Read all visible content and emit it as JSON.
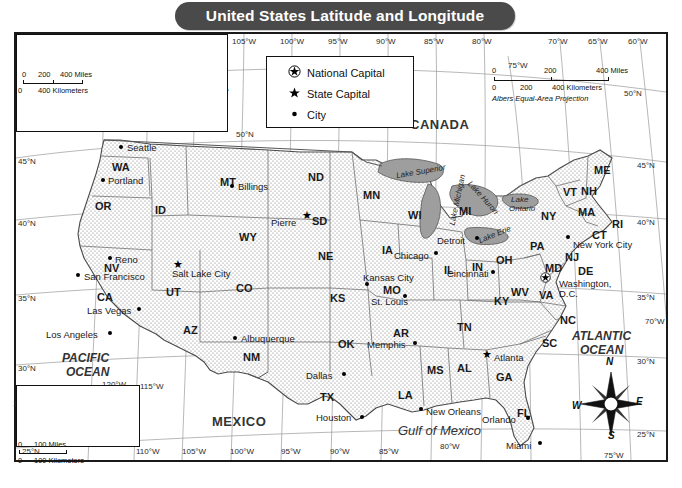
{
  "title": "United States Latitude and Longitude",
  "legend": {
    "title": "",
    "items": [
      {
        "symbol": "national-capital",
        "label": "National Capital"
      },
      {
        "symbol": "state-capital",
        "label": "State Capital"
      },
      {
        "symbol": "city",
        "label": "City"
      }
    ]
  },
  "projection_note": "Albers Equal-Area Projection",
  "main_scale": {
    "miles": [
      "0",
      "200",
      "400 Miles"
    ],
    "kilometers": [
      "0",
      "200",
      "400 Kilometers"
    ]
  },
  "alaska_scale": {
    "miles": [
      "0",
      "200",
      "400 Miles"
    ],
    "kilometers": [
      "0",
      "400 Kilometers"
    ]
  },
  "hawaii_scale": {
    "miles": [
      "0",
      "100 Miles"
    ],
    "kilometers": [
      "0",
      "100 Kilometers"
    ]
  },
  "countries": [
    {
      "name": "CANADA",
      "x": 410,
      "y": 118
    },
    {
      "name": "MEXICO",
      "x": 212,
      "y": 415
    },
    {
      "name": "RUSSIA",
      "x": 55,
      "y": 47
    },
    {
      "name": "CANADA",
      "x": 170,
      "y": 80
    }
  ],
  "oceans": [
    {
      "name": "PACIFIC",
      "x": 62,
      "y": 352
    },
    {
      "name": "OCEAN",
      "x": 66,
      "y": 366
    },
    {
      "name": "ATLANTIC",
      "x": 572,
      "y": 330
    },
    {
      "name": "OCEAN",
      "x": 580,
      "y": 344
    },
    {
      "name": "Gulf of Mexico",
      "x": 398,
      "y": 424
    }
  ],
  "lakes": [
    {
      "name": "Lake Superior",
      "x": 396,
      "y": 168
    },
    {
      "name": "Lake Michigan",
      "x": 432,
      "y": 196
    },
    {
      "name": "Lake Huron",
      "x": 462,
      "y": 194
    },
    {
      "name": "Lake Erie",
      "x": 478,
      "y": 231
    },
    {
      "name": "Lake",
      "x": 511,
      "y": 196
    },
    {
      "name": "Ontario",
      "x": 509,
      "y": 205
    }
  ],
  "states": [
    {
      "abbr": "WA",
      "x": 112,
      "y": 162
    },
    {
      "abbr": "OR",
      "x": 95,
      "y": 201
    },
    {
      "abbr": "ID",
      "x": 155,
      "y": 205
    },
    {
      "abbr": "MT",
      "x": 220,
      "y": 177
    },
    {
      "abbr": "ND",
      "x": 308,
      "y": 172
    },
    {
      "abbr": "SD",
      "x": 312,
      "y": 216
    },
    {
      "abbr": "MN",
      "x": 363,
      "y": 190
    },
    {
      "abbr": "WI",
      "x": 408,
      "y": 210
    },
    {
      "abbr": "MI",
      "x": 459,
      "y": 206
    },
    {
      "abbr": "NY",
      "x": 541,
      "y": 211
    },
    {
      "abbr": "ME",
      "x": 594,
      "y": 165
    },
    {
      "abbr": "VT",
      "x": 563,
      "y": 187
    },
    {
      "abbr": "NH",
      "x": 581,
      "y": 186
    },
    {
      "abbr": "MA",
      "x": 578,
      "y": 207
    },
    {
      "abbr": "RI",
      "x": 612,
      "y": 219
    },
    {
      "abbr": "CT",
      "x": 592,
      "y": 230
    },
    {
      "abbr": "PA",
      "x": 530,
      "y": 241
    },
    {
      "abbr": "NJ",
      "x": 565,
      "y": 252
    },
    {
      "abbr": "OH",
      "x": 496,
      "y": 255
    },
    {
      "abbr": "IN",
      "x": 472,
      "y": 262
    },
    {
      "abbr": "IL",
      "x": 444,
      "y": 265
    },
    {
      "abbr": "IA",
      "x": 382,
      "y": 245
    },
    {
      "abbr": "NE",
      "x": 318,
      "y": 251
    },
    {
      "abbr": "WY",
      "x": 239,
      "y": 232
    },
    {
      "abbr": "NV",
      "x": 104,
      "y": 263
    },
    {
      "abbr": "UT",
      "x": 166,
      "y": 287
    },
    {
      "abbr": "CA",
      "x": 97,
      "y": 292
    },
    {
      "abbr": "CO",
      "x": 236,
      "y": 283
    },
    {
      "abbr": "KS",
      "x": 330,
      "y": 293
    },
    {
      "abbr": "MO",
      "x": 383,
      "y": 285
    },
    {
      "abbr": "KY",
      "x": 494,
      "y": 296
    },
    {
      "abbr": "WV",
      "x": 511,
      "y": 287
    },
    {
      "abbr": "VA",
      "x": 539,
      "y": 290
    },
    {
      "abbr": "MD",
      "x": 545,
      "y": 263
    },
    {
      "abbr": "DE",
      "x": 578,
      "y": 266
    },
    {
      "abbr": "NC",
      "x": 560,
      "y": 315
    },
    {
      "abbr": "TN",
      "x": 457,
      "y": 322
    },
    {
      "abbr": "SC",
      "x": 542,
      "y": 338
    },
    {
      "abbr": "AR",
      "x": 393,
      "y": 328
    },
    {
      "abbr": "AZ",
      "x": 183,
      "y": 325
    },
    {
      "abbr": "NM",
      "x": 243,
      "y": 352
    },
    {
      "abbr": "OK",
      "x": 338,
      "y": 339
    },
    {
      "abbr": "TX",
      "x": 320,
      "y": 392
    },
    {
      "abbr": "LA",
      "x": 398,
      "y": 390
    },
    {
      "abbr": "MS",
      "x": 427,
      "y": 365
    },
    {
      "abbr": "AL",
      "x": 457,
      "y": 363
    },
    {
      "abbr": "GA",
      "x": 496,
      "y": 372
    },
    {
      "abbr": "FL",
      "x": 517,
      "y": 408
    }
  ],
  "cities": [
    {
      "name": "Seattle",
      "x": 121,
      "y": 147,
      "type": "city",
      "dx": 6,
      "dy": -4
    },
    {
      "name": "Portland",
      "x": 103,
      "y": 180,
      "type": "city",
      "dx": 5,
      "dy": -4
    },
    {
      "name": "Billings",
      "x": 232,
      "y": 186,
      "type": "city",
      "dx": 6,
      "dy": -4
    },
    {
      "name": "Pierre",
      "x": 307,
      "y": 216,
      "type": "capital",
      "dx": -36,
      "dy": 2
    },
    {
      "name": "Reno",
      "x": 110,
      "y": 258,
      "type": "city",
      "dx": 5,
      "dy": -3
    },
    {
      "name": "San Francisco",
      "x": 78,
      "y": 275,
      "type": "city",
      "dx": 6,
      "dy": -3
    },
    {
      "name": "Salt Lake City",
      "x": 178,
      "y": 265,
      "type": "capital",
      "dx": -6,
      "dy": 4
    },
    {
      "name": "Las Vegas",
      "x": 139,
      "y": 309,
      "type": "city",
      "dx": -52,
      "dy": -3
    },
    {
      "name": "Los Angeles",
      "x": 110,
      "y": 333,
      "type": "city",
      "dx": -64,
      "dy": -3
    },
    {
      "name": "Albuquerque",
      "x": 235,
      "y": 338,
      "type": "city",
      "dx": 6,
      "dy": -4
    },
    {
      "name": "Dallas",
      "x": 344,
      "y": 374,
      "type": "city",
      "dx": -38,
      "dy": -3
    },
    {
      "name": "Houston",
      "x": 362,
      "y": 417,
      "type": "city",
      "dx": -46,
      "dy": -4
    },
    {
      "name": "Kansas City",
      "x": 367,
      "y": 284,
      "type": "city",
      "dx": -4,
      "dy": -11
    },
    {
      "name": "St. Louis",
      "x": 405,
      "y": 296,
      "type": "city",
      "dx": -34,
      "dy": 1
    },
    {
      "name": "Chicago",
      "x": 436,
      "y": 253,
      "type": "city",
      "dx": -42,
      "dy": -2
    },
    {
      "name": "Detroit",
      "x": 477,
      "y": 238,
      "type": "city",
      "dx": -40,
      "dy": -2
    },
    {
      "name": "Cincinnati",
      "x": 493,
      "y": 272,
      "type": "city",
      "dx": -46,
      "dy": -3
    },
    {
      "name": "Memphis",
      "x": 415,
      "y": 343,
      "type": "city",
      "dx": -48,
      "dy": -3
    },
    {
      "name": "Atlanta",
      "x": 487,
      "y": 355,
      "type": "capital",
      "dx": 7,
      "dy": -2
    },
    {
      "name": "New Orleans",
      "x": 421,
      "y": 409,
      "type": "city",
      "dx": 5,
      "dy": -2
    },
    {
      "name": "Orlando",
      "x": 528,
      "y": 418,
      "type": "city",
      "dx": -46,
      "dy": -3
    },
    {
      "name": "Miami",
      "x": 540,
      "y": 443,
      "type": "city",
      "dx": -34,
      "dy": -2
    },
    {
      "name": "New York City",
      "x": 568,
      "y": 237,
      "type": "city",
      "dx": 5,
      "dy": 3
    },
    {
      "name": "Washington, D.C.",
      "x": 545,
      "y": 274,
      "type": "national",
      "dx": 14,
      "dy": 5
    }
  ],
  "dc_label_line2": "D.C.",
  "alaska_inset": {
    "places": [
      {
        "name": "RUSSIA",
        "x": 38,
        "y": 12,
        "cls": "country-sm"
      },
      {
        "name": "ALASKA",
        "x": 110,
        "y": 50,
        "cls": "country-sm"
      },
      {
        "name": "CANADA",
        "x": 160,
        "y": 59,
        "cls": "country-sm"
      },
      {
        "name": "Juneau",
        "x": 128,
        "y": 72,
        "cls": "city-sm"
      },
      {
        "name": "PACIFIC",
        "x": 130,
        "y": 80,
        "cls": "ocean-sm"
      },
      {
        "name": "OCEAN",
        "x": 130,
        "y": 88,
        "cls": "ocean-sm"
      }
    ],
    "grid": [
      {
        "t": "65°N",
        "x": 14,
        "y": 3
      },
      {
        "t": "60°N",
        "x": 6,
        "y": 24
      },
      {
        "t": "55°N",
        "x": 38,
        "y": 74
      },
      {
        "t": "70°N",
        "x": 135,
        "y": 4
      },
      {
        "t": "180°",
        "x": 5,
        "y": 86
      },
      {
        "t": "170°W",
        "x": 42,
        "y": 90
      },
      {
        "t": "160°W",
        "x": 76,
        "y": 90
      },
      {
        "t": "150°W",
        "x": 112,
        "y": 90
      },
      {
        "t": "140°W",
        "x": 148,
        "y": 90
      }
    ]
  },
  "hawaii_inset": {
    "places": [
      {
        "name": "HAWAII",
        "x": 30,
        "y": 3,
        "cls": "country-sm"
      },
      {
        "name": "Honolulu",
        "x": 10,
        "y": 24,
        "cls": "city-sm"
      },
      {
        "name": "PACIFIC",
        "x": 38,
        "y": 31,
        "cls": "ocean-sm"
      },
      {
        "name": "OCEAN",
        "x": 38,
        "y": 41,
        "cls": "ocean-sm"
      }
    ],
    "grid": [
      {
        "t": "160°W",
        "x": -4,
        "y": 14
      },
      {
        "t": "155°W",
        "x": 78,
        "y": 14
      },
      {
        "t": "20°N",
        "x": 12,
        "y": 36
      }
    ]
  },
  "graticule": {
    "top_longitudes": [
      "110°W",
      "105°W",
      "100°W",
      "95°W",
      "90°W",
      "85°W",
      "80°W",
      "70°W",
      "65°W",
      "60°W"
    ],
    "top_longitudes_x": [
      196,
      244,
      292,
      340,
      388,
      436,
      484,
      560,
      600,
      640
    ],
    "upper_extra": [
      {
        "t": "75°W",
        "x": 508,
        "y": 62
      },
      {
        "t": "50°N",
        "x": 624,
        "y": 90
      }
    ],
    "bottom_longitudes": [
      "110°W",
      "105°W",
      "100°W",
      "95°W",
      "90°W",
      "85°W"
    ],
    "bottom_longitudes_x": [
      136,
      182,
      230,
      281,
      330,
      379
    ],
    "bottom_extra": [
      {
        "t": "120°W",
        "x": 102,
        "y": 381
      },
      {
        "t": "115°W",
        "x": 140,
        "y": 383
      },
      {
        "t": "80°W",
        "x": 440,
        "y": 443
      },
      {
        "t": "75°W",
        "x": 604,
        "y": 452
      }
    ],
    "left_latitudes": [
      "45°N",
      "40°N",
      "35°N",
      "30°N"
    ],
    "left_latitudes_y": [
      158,
      220,
      295,
      365
    ],
    "right_latitudes": [
      "45°N",
      "40°N",
      "35°N",
      "30°N",
      "25°N"
    ],
    "right_latitudes_y": [
      162,
      219,
      294,
      358,
      431
    ],
    "right_extra": [
      {
        "t": "70°W",
        "x": 645,
        "y": 318
      },
      {
        "t": "25°N",
        "x": 22,
        "y": 448
      }
    ],
    "left_lower": [
      {
        "t": "50°N",
        "x": 236,
        "y": 131
      }
    ]
  },
  "compass": {
    "n": "N",
    "e": "E",
    "s": "S",
    "w": "W"
  },
  "colors": {
    "banner": "#4a4a4a",
    "land": "#efefef",
    "water": "#ffffff",
    "lake": "#9a9a9a",
    "border": "#1a1a1a"
  }
}
